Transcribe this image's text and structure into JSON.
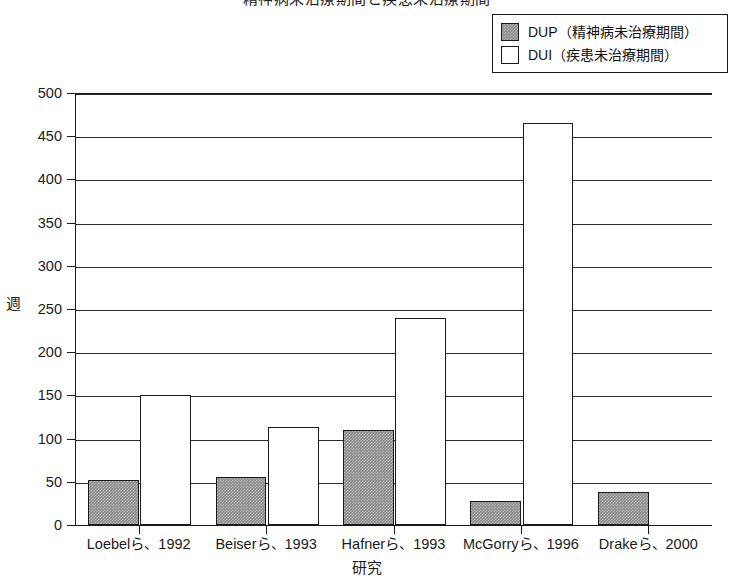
{
  "chart_data": {
    "type": "bar",
    "title": "精神病未治療期間と疾患未治療期間",
    "xlabel": "研究",
    "ylabel": "週",
    "ylim": [
      0,
      500
    ],
    "ytick_step": 50,
    "grid": true,
    "legend_position": "top-right",
    "categories": [
      "Loebelら、1992",
      "Beiserら、1993",
      "Hafnerら、1993",
      "McGorryら、1996",
      "Drakeら、2000"
    ],
    "yticks": [
      0,
      50,
      100,
      150,
      200,
      250,
      300,
      350,
      400,
      450,
      500
    ],
    "series": [
      {
        "name": "DUP（精神病未治療期間）",
        "key": "dup",
        "fill": "gray-hatched",
        "color": "#8d8d8d",
        "values": [
          52,
          56,
          110,
          28,
          38
        ]
      },
      {
        "name": "DUI（疾患未治療期間）",
        "key": "dui",
        "fill": "white",
        "color": "#ffffff",
        "values": [
          151,
          113,
          240,
          465,
          0
        ]
      }
    ]
  },
  "legend": {
    "items": [
      {
        "label": "DUP（精神病未治療期間）",
        "swatch": "dup"
      },
      {
        "label": "DUI（疾患未治療期間）",
        "swatch": "dui"
      }
    ]
  }
}
